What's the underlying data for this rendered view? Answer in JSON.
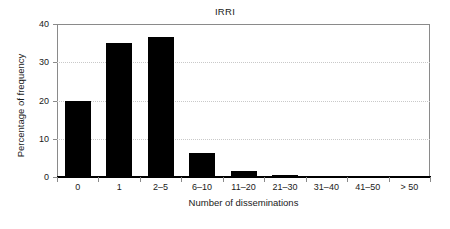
{
  "chart_data": {
    "type": "bar",
    "title": "IRRI",
    "xlabel": "Number of disseminations",
    "ylabel": "Percentage of frequency",
    "categories": [
      "0",
      "1",
      "2–5",
      "6–10",
      "11–20",
      "21–30",
      "31–40",
      "41–50",
      "> 50"
    ],
    "values": [
      20.0,
      35.1,
      36.7,
      6.3,
      1.6,
      0.4,
      0.2,
      0.2,
      0.2
    ],
    "ylim": [
      0,
      40
    ],
    "yticks": [
      0,
      10,
      20,
      30,
      40
    ],
    "ytick_labels": [
      "0",
      "10",
      "20",
      "30",
      "40"
    ],
    "gridlines": [
      10,
      20,
      30
    ],
    "grid": true,
    "legend": null,
    "bar_color": "#000000",
    "axis_color": "#8a8a8a",
    "grid_color": "#c9c9c9",
    "background": "#ffffff"
  }
}
